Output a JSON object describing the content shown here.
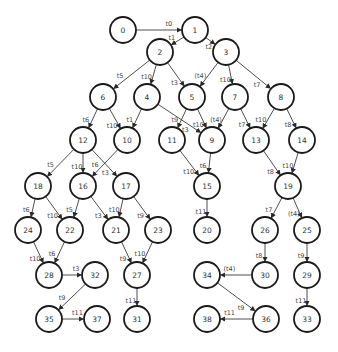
{
  "diagram": {
    "type": "directed-graph",
    "node_radius": 13,
    "colors": {
      "node_stroke": "#1a1a1a",
      "node_fill": "#ffffff",
      "edge": "#3a3a3a",
      "text": "#333333"
    },
    "nodes": [
      {
        "id": "0",
        "x": 123,
        "y": 30
      },
      {
        "id": "1",
        "x": 195,
        "y": 30
      },
      {
        "id": "2",
        "x": 160,
        "y": 52
      },
      {
        "id": "3",
        "x": 226,
        "y": 52
      },
      {
        "id": "6",
        "x": 103,
        "y": 97
      },
      {
        "id": "4",
        "x": 147,
        "y": 97
      },
      {
        "id": "5",
        "x": 192,
        "y": 97
      },
      {
        "id": "7",
        "x": 235,
        "y": 97
      },
      {
        "id": "8",
        "x": 281,
        "y": 97
      },
      {
        "id": "12",
        "x": 83,
        "y": 140
      },
      {
        "id": "10",
        "x": 127,
        "y": 140
      },
      {
        "id": "11",
        "x": 172,
        "y": 140
      },
      {
        "id": "9",
        "x": 212,
        "y": 140
      },
      {
        "id": "13",
        "x": 256,
        "y": 140
      },
      {
        "id": "14",
        "x": 302,
        "y": 140
      },
      {
        "id": "18",
        "x": 38,
        "y": 186
      },
      {
        "id": "16",
        "x": 83,
        "y": 186
      },
      {
        "id": "17",
        "x": 126,
        "y": 186
      },
      {
        "id": "15",
        "x": 207,
        "y": 186
      },
      {
        "id": "19",
        "x": 288,
        "y": 186
      },
      {
        "id": "24",
        "x": 28,
        "y": 230
      },
      {
        "id": "22",
        "x": 70,
        "y": 230
      },
      {
        "id": "21",
        "x": 116,
        "y": 230
      },
      {
        "id": "23",
        "x": 158,
        "y": 230
      },
      {
        "id": "20",
        "x": 207,
        "y": 230
      },
      {
        "id": "26",
        "x": 265,
        "y": 230
      },
      {
        "id": "25",
        "x": 307,
        "y": 230
      },
      {
        "id": "28",
        "x": 49,
        "y": 275
      },
      {
        "id": "32",
        "x": 95,
        "y": 275
      },
      {
        "id": "27",
        "x": 137,
        "y": 275
      },
      {
        "id": "34",
        "x": 207,
        "y": 275
      },
      {
        "id": "30",
        "x": 265,
        "y": 275
      },
      {
        "id": "29",
        "x": 307,
        "y": 275
      },
      {
        "id": "35",
        "x": 49,
        "y": 319
      },
      {
        "id": "37",
        "x": 97,
        "y": 319
      },
      {
        "id": "31",
        "x": 137,
        "y": 319
      },
      {
        "id": "38",
        "x": 207,
        "y": 319
      },
      {
        "id": "36",
        "x": 266,
        "y": 319
      },
      {
        "id": "33",
        "x": 307,
        "y": 319
      }
    ],
    "edges": [
      {
        "from": "0",
        "to": "1",
        "label": "t0"
      },
      {
        "from": "1",
        "to": "2",
        "label": "t1"
      },
      {
        "from": "1",
        "to": "3",
        "label": "t2"
      },
      {
        "from": "2",
        "to": "6",
        "label": "t5"
      },
      {
        "from": "2",
        "to": "4",
        "label": "t10"
      },
      {
        "from": "2",
        "to": "5",
        "label": "t3"
      },
      {
        "from": "3",
        "to": "5",
        "label": "(t4)"
      },
      {
        "from": "3",
        "to": "7",
        "label": "t10"
      },
      {
        "from": "3",
        "to": "8",
        "label": "t7"
      },
      {
        "from": "6",
        "to": "12",
        "label": "t6"
      },
      {
        "from": "6",
        "to": "10",
        "label": "t10"
      },
      {
        "from": "4",
        "to": "10",
        "label": "t1"
      },
      {
        "from": "4",
        "to": "9",
        "label": "t3"
      },
      {
        "from": "5",
        "to": "11",
        "label": "t9"
      },
      {
        "from": "5",
        "to": "9",
        "label": "t10"
      },
      {
        "from": "7",
        "to": "9",
        "label": "(t4)"
      },
      {
        "from": "7",
        "to": "13",
        "label": "t7"
      },
      {
        "from": "8",
        "to": "13",
        "label": "t10"
      },
      {
        "from": "8",
        "to": "14",
        "label": "t8"
      },
      {
        "from": "12",
        "to": "18",
        "label": "t5"
      },
      {
        "from": "12",
        "to": "16",
        "label": "t10"
      },
      {
        "from": "12",
        "to": "17",
        "label": "t3"
      },
      {
        "from": "10",
        "to": "16",
        "label": "t6"
      },
      {
        "from": "11",
        "to": "15",
        "label": "t10"
      },
      {
        "from": "9",
        "to": "15",
        "label": "t6"
      },
      {
        "from": "13",
        "to": "19",
        "label": "t8"
      },
      {
        "from": "14",
        "to": "19",
        "label": "t10"
      },
      {
        "from": "18",
        "to": "24",
        "label": "t6"
      },
      {
        "from": "18",
        "to": "22",
        "label": "t10"
      },
      {
        "from": "16",
        "to": "22",
        "label": "t5"
      },
      {
        "from": "16",
        "to": "21",
        "label": "t3"
      },
      {
        "from": "17",
        "to": "21",
        "label": "t10"
      },
      {
        "from": "17",
        "to": "23",
        "label": "t9"
      },
      {
        "from": "15",
        "to": "20",
        "label": "t11"
      },
      {
        "from": "19",
        "to": "26",
        "label": "t7"
      },
      {
        "from": "19",
        "to": "25",
        "label": "(t4)"
      },
      {
        "from": "24",
        "to": "28",
        "label": "t10"
      },
      {
        "from": "22",
        "to": "28",
        "label": "t6"
      },
      {
        "from": "21",
        "to": "27",
        "label": "t9"
      },
      {
        "from": "23",
        "to": "27",
        "label": "t10"
      },
      {
        "from": "26",
        "to": "30",
        "label": "t8"
      },
      {
        "from": "25",
        "to": "29",
        "label": "t9"
      },
      {
        "from": "28",
        "to": "32",
        "label": "t3"
      },
      {
        "from": "32",
        "to": "35",
        "label": "t9"
      },
      {
        "from": "27",
        "to": "31",
        "label": "t11"
      },
      {
        "from": "30",
        "to": "34",
        "label": "(t4)"
      },
      {
        "from": "29",
        "to": "33",
        "label": "t11"
      },
      {
        "from": "35",
        "to": "37",
        "label": "t11"
      },
      {
        "from": "34",
        "to": "36",
        "label": "t9"
      },
      {
        "from": "36",
        "to": "38",
        "label": "t11"
      }
    ]
  }
}
